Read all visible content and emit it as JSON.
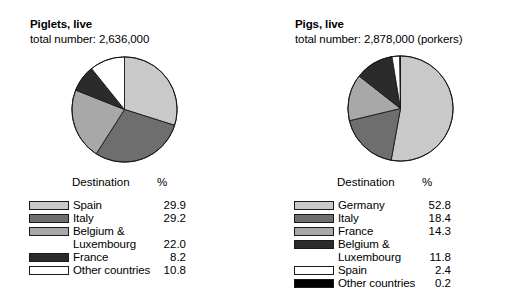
{
  "chart_data": [
    {
      "type": "pie",
      "title": "Piglets, live",
      "subtitle": "total number: 2,636,000",
      "total_number": "2,636,000",
      "col_header_destination": "Destination",
      "col_header_percent": "%",
      "categories": [
        "Spain",
        "Italy",
        "Belgium & Luxembourg",
        "France",
        "Other countries"
      ],
      "values": [
        29.9,
        29.2,
        22.0,
        8.2,
        10.8
      ],
      "colors": [
        "#c9c9c9",
        "#6e6e6e",
        "#a8a8a8",
        "#2b2b2b",
        "#ffffff"
      ],
      "start_angle": 0,
      "direction": "clockwise",
      "legend_position": "below",
      "grid": false,
      "xlabel": "",
      "ylabel": ""
    },
    {
      "type": "pie",
      "title": "Pigs, live",
      "subtitle": "total number: 2,878,000 (porkers)",
      "total_number": "2,878,000",
      "note": "(porkers)",
      "col_header_destination": "Destination",
      "col_header_percent": "%",
      "categories": [
        "Germany",
        "Italy",
        "France",
        "Belgium & Luxembourg",
        "Spain",
        "Other countries"
      ],
      "values": [
        52.8,
        18.4,
        14.3,
        11.8,
        2.4,
        0.2
      ],
      "colors": [
        "#c9c9c9",
        "#6e6e6e",
        "#a8a8a8",
        "#2b2b2b",
        "#ffffff",
        "#000000"
      ],
      "start_angle": 0,
      "direction": "clockwise",
      "legend_position": "below",
      "grid": false,
      "xlabel": "",
      "ylabel": ""
    }
  ],
  "left": {
    "title": "Piglets, live",
    "subtitle": "total number: 2,636,000",
    "header": {
      "destination": "Destination",
      "percent": "%"
    },
    "rows": [
      {
        "label": "Spain",
        "value": "29.9",
        "color": "#c9c9c9",
        "swatch": true
      },
      {
        "label": "Italy",
        "value": "29.2",
        "color": "#6e6e6e",
        "swatch": true
      },
      {
        "label": "Belgium &",
        "value": "",
        "color": "#a8a8a8",
        "swatch": true
      },
      {
        "label": "Luxembourg",
        "value": "22.0",
        "color": "",
        "swatch": false
      },
      {
        "label": "France",
        "value": "8.2",
        "color": "#2b2b2b",
        "swatch": true
      },
      {
        "label": "Other countries",
        "value": "10.8",
        "color": "#ffffff",
        "swatch": true
      }
    ]
  },
  "right": {
    "title": "Pigs, live",
    "subtitle": "total number: 2,878,000 (porkers)",
    "header": {
      "destination": "Destination",
      "percent": "%"
    },
    "rows": [
      {
        "label": "Germany",
        "value": "52.8",
        "color": "#c9c9c9",
        "swatch": true
      },
      {
        "label": "Italy",
        "value": "18.4",
        "color": "#6e6e6e",
        "swatch": true
      },
      {
        "label": "France",
        "value": "14.3",
        "color": "#a8a8a8",
        "swatch": true
      },
      {
        "label": "Belgium &",
        "value": "",
        "color": "#2b2b2b",
        "swatch": true
      },
      {
        "label": "Luxembourg",
        "value": "11.8",
        "color": "",
        "swatch": false
      },
      {
        "label": "Spain",
        "value": "2.4",
        "color": "#ffffff",
        "swatch": true
      },
      {
        "label": "Other countries",
        "value": "0.2",
        "color": "#000000",
        "swatch": true
      }
    ]
  }
}
